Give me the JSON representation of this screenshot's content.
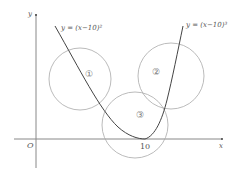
{
  "diagram": {
    "axes": {
      "x_label": "x",
      "y_label": "y",
      "origin_label": "O",
      "x_tick": "10"
    },
    "curves": [
      {
        "id": "parabola",
        "label": "y = (x−10)²"
      },
      {
        "id": "cubic",
        "label": "y = (x−10)³"
      }
    ],
    "regions": [
      {
        "id": "circle-1",
        "label": "①"
      },
      {
        "id": "circle-2",
        "label": "②"
      },
      {
        "id": "circle-3",
        "label": "③"
      }
    ],
    "colors": {
      "axis": "#888888",
      "curve": "#444444",
      "circle": "#aaaaaa"
    }
  }
}
